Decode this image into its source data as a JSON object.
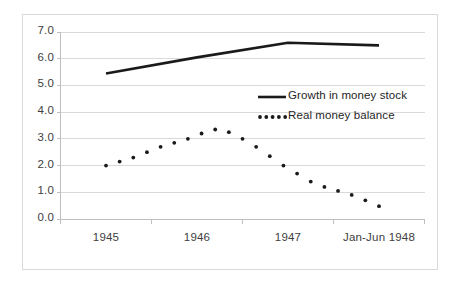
{
  "chart_data": {
    "type": "line",
    "title": "",
    "xlabel": "",
    "ylabel": "",
    "categories": [
      "1945",
      "1946",
      "1947",
      "Jan-Jun 1948"
    ],
    "yticks": [
      "0.0",
      "1.0",
      "2.0",
      "3.0",
      "4.0",
      "5.0",
      "6.0",
      "7.0"
    ],
    "ylim": [
      0.0,
      7.0
    ],
    "grid": true,
    "legend_position": "center-right",
    "series": [
      {
        "name": "Growth in money stock",
        "style": "solid",
        "color": "#1a1a1a",
        "x": [
          0.5,
          1.5,
          2.5,
          3.5
        ],
        "values": [
          5.45,
          6.05,
          6.6,
          6.5
        ]
      },
      {
        "name": "Real money balance",
        "style": "dotted",
        "color": "#1a1a1a",
        "x": [
          0.5,
          0.65,
          0.8,
          0.95,
          1.1,
          1.25,
          1.4,
          1.55,
          1.7,
          1.85,
          2.0,
          2.15,
          2.3,
          2.45,
          2.6,
          2.75,
          2.9,
          3.05,
          3.2,
          3.35,
          3.5
        ],
        "values": [
          2.0,
          2.15,
          2.3,
          2.5,
          2.7,
          2.85,
          3.0,
          3.2,
          3.35,
          3.25,
          3.0,
          2.7,
          2.35,
          2.0,
          1.7,
          1.4,
          1.2,
          1.05,
          0.9,
          0.7,
          0.48
        ]
      }
    ]
  },
  "axis": {
    "x_tick_positions": [
      0,
      1,
      2,
      3,
      4
    ]
  }
}
